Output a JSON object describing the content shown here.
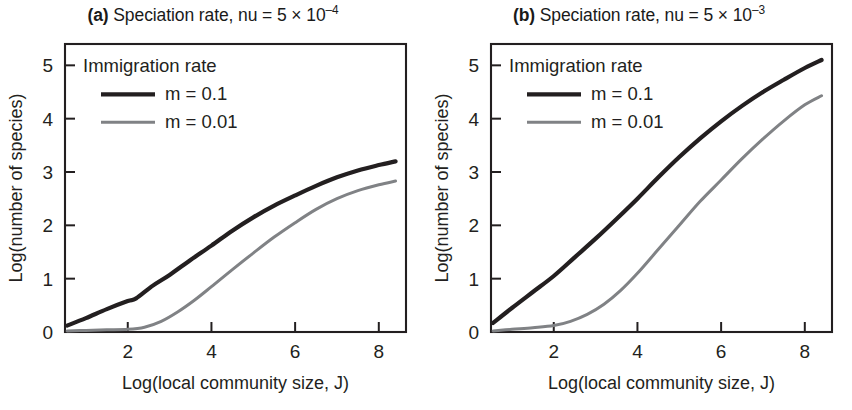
{
  "figure": {
    "background": "#ffffff",
    "text_color": "#231f20"
  },
  "chart_data": [
    {
      "id": "panel-a",
      "type": "line",
      "panel_tag": "(a)",
      "title": "Speciation rate, nu = 5 × 10",
      "title_exponent": "–4",
      "title_full": "(a) Speciation rate, nu = 5 × 10−4",
      "xlabel": "Log(local community size, J)",
      "ylabel": "Log(number of species)",
      "xlim": [
        0.5,
        8.65
      ],
      "ylim": [
        0,
        5.4
      ],
      "xticks": [
        2,
        4,
        6,
        8
      ],
      "yticks": [
        0,
        1,
        2,
        3,
        4,
        5
      ],
      "xticklabels": [
        "2",
        "4",
        "6",
        "8"
      ],
      "yticklabels": [
        "0",
        "1",
        "2",
        "3",
        "4",
        "5"
      ],
      "grid": false,
      "legend": {
        "title": "Immigration rate",
        "position": "upper-left",
        "entries": [
          {
            "label": "m = 0.1",
            "color": "#231f20",
            "width": 4.2
          },
          {
            "label": "m = 0.01",
            "color": "#808285",
            "width": 3.0
          }
        ]
      },
      "series": [
        {
          "name": "m = 0.1",
          "color": "#231f20",
          "width": 4.2,
          "x": [
            0.55,
            1.0,
            1.5,
            2.0,
            2.2,
            2.6,
            3.0,
            3.5,
            4.0,
            4.5,
            5.0,
            5.5,
            6.0,
            6.5,
            7.0,
            7.5,
            8.0,
            8.4
          ],
          "y": [
            0.12,
            0.26,
            0.43,
            0.58,
            0.63,
            0.87,
            1.07,
            1.35,
            1.62,
            1.9,
            2.15,
            2.37,
            2.56,
            2.74,
            2.9,
            3.03,
            3.13,
            3.2
          ]
        },
        {
          "name": "m = 0.01",
          "color": "#808285",
          "width": 3.0,
          "x": [
            0.55,
            1.0,
            1.5,
            2.0,
            2.4,
            2.8,
            3.2,
            3.6,
            4.0,
            4.5,
            5.0,
            5.5,
            6.0,
            6.5,
            7.0,
            7.5,
            8.0,
            8.4
          ],
          "y": [
            0.02,
            0.03,
            0.04,
            0.05,
            0.09,
            0.2,
            0.38,
            0.6,
            0.85,
            1.17,
            1.48,
            1.78,
            2.05,
            2.3,
            2.5,
            2.65,
            2.76,
            2.83
          ]
        }
      ]
    },
    {
      "id": "panel-b",
      "type": "line",
      "panel_tag": "(b)",
      "title": "Speciation rate, nu = 5 × 10",
      "title_exponent": "–3",
      "title_full": "(b) Speciation rate, nu = 5 × 10−3",
      "xlabel": "Log(local community size, J)",
      "ylabel": "Log(number of species)",
      "xlim": [
        0.5,
        8.65
      ],
      "ylim": [
        0,
        5.4
      ],
      "xticks": [
        2,
        4,
        6,
        8
      ],
      "yticks": [
        0,
        1,
        2,
        3,
        4,
        5
      ],
      "xticklabels": [
        "2",
        "4",
        "6",
        "8"
      ],
      "yticklabels": [
        "0",
        "1",
        "2",
        "3",
        "4",
        "5"
      ],
      "grid": false,
      "legend": {
        "title": "Immigration rate",
        "position": "upper-left",
        "entries": [
          {
            "label": "m = 0.1",
            "color": "#231f20",
            "width": 4.2
          },
          {
            "label": "m = 0.01",
            "color": "#808285",
            "width": 3.0
          }
        ]
      },
      "series": [
        {
          "name": "m = 0.1",
          "color": "#231f20",
          "width": 4.2,
          "x": [
            0.55,
            1.0,
            1.5,
            2.0,
            2.5,
            3.0,
            3.5,
            4.0,
            4.5,
            5.0,
            5.5,
            6.0,
            6.5,
            7.0,
            7.5,
            8.0,
            8.4
          ],
          "y": [
            0.17,
            0.45,
            0.75,
            1.05,
            1.4,
            1.75,
            2.12,
            2.5,
            2.9,
            3.28,
            3.63,
            3.95,
            4.24,
            4.5,
            4.73,
            4.95,
            5.1
          ]
        },
        {
          "name": "m = 0.01",
          "color": "#808285",
          "width": 3.0,
          "x": [
            0.55,
            1.0,
            1.5,
            2.0,
            2.4,
            2.8,
            3.2,
            3.6,
            4.0,
            4.5,
            5.0,
            5.5,
            6.0,
            6.5,
            7.0,
            7.5,
            8.0,
            8.4
          ],
          "y": [
            0.02,
            0.05,
            0.08,
            0.12,
            0.2,
            0.33,
            0.52,
            0.78,
            1.1,
            1.55,
            2.0,
            2.45,
            2.85,
            3.25,
            3.62,
            3.96,
            4.26,
            4.43
          ]
        }
      ]
    }
  ]
}
